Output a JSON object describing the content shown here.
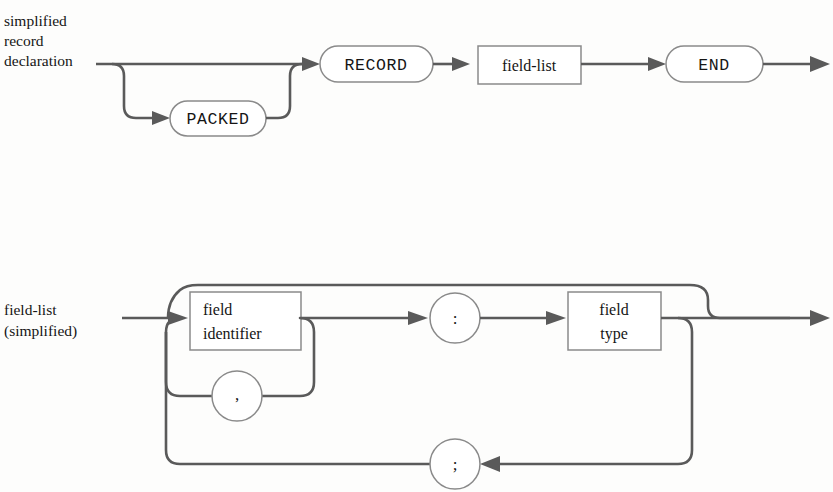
{
  "page": {
    "background": "#fdfdfc",
    "line_color": "#5a5a5a",
    "node_stroke": "#8a8a8a",
    "node_fill": "#ffffff",
    "text_color": "#151515",
    "width": 833,
    "height": 492
  },
  "diagrams": [
    {
      "id": "record-declaration",
      "side_label_lines": [
        "simplified",
        "record",
        "declaration"
      ],
      "nodes": [
        {
          "id": "packed",
          "kind": "terminal",
          "shape": "stadium",
          "label": "PACKED",
          "font": "mono"
        },
        {
          "id": "record",
          "kind": "terminal",
          "shape": "stadium",
          "label": "RECORD",
          "font": "mono"
        },
        {
          "id": "field-list",
          "kind": "nonterminal",
          "shape": "rectangle",
          "label": "field-list",
          "font": "serif"
        },
        {
          "id": "end",
          "kind": "terminal",
          "shape": "stadium",
          "label": "END",
          "font": "mono"
        }
      ],
      "paths_description": "optional PACKED bypass, then RECORD, field-list, END"
    },
    {
      "id": "field-list-simplified",
      "side_label_lines": [
        "field-list",
        "(simplified)"
      ],
      "nodes": [
        {
          "id": "field-identifier",
          "kind": "nonterminal",
          "shape": "rectangle",
          "label_lines": [
            "field",
            "identifier"
          ],
          "font": "serif"
        },
        {
          "id": "comma",
          "kind": "terminal",
          "shape": "circle",
          "label": ",",
          "font": "serif"
        },
        {
          "id": "colon",
          "kind": "terminal",
          "shape": "circle",
          "label": ":",
          "font": "serif"
        },
        {
          "id": "field-type",
          "kind": "nonterminal",
          "shape": "rectangle",
          "label_lines": [
            "field",
            "type"
          ],
          "font": "serif"
        },
        {
          "id": "semicolon",
          "kind": "terminal",
          "shape": "circle",
          "label": ";",
          "font": "serif"
        }
      ],
      "paths_description": "field identifier list separated by commas, colon, field type, repeated groups separated by semicolons, optional trailing semicolon bypass"
    }
  ]
}
